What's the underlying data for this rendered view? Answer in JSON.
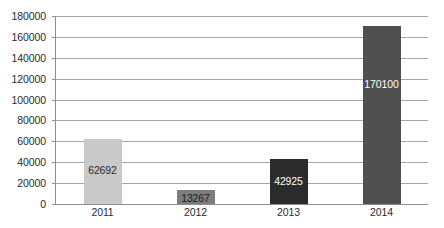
{
  "chart_data": {
    "type": "bar",
    "title": "",
    "subtitle": "",
    "xlabel": "",
    "ylabel": "",
    "categories": [
      "2011",
      "2012",
      "2013",
      "2014"
    ],
    "values": [
      62692,
      13267,
      42925,
      170100
    ],
    "data_labels": [
      "62692",
      "13267",
      "42925",
      "170100"
    ],
    "ylim": [
      0,
      180000
    ],
    "ytick_step": 20000,
    "ytick_labels": [
      "180000",
      "160000",
      "140000",
      "120000",
      "100000",
      "80000",
      "60000",
      "40000",
      "20000",
      "0"
    ],
    "ytick_values": [
      180000,
      160000,
      140000,
      120000,
      100000,
      80000,
      60000,
      40000,
      20000,
      0
    ],
    "grid": "horizontal",
    "legend": "none",
    "bar_colors": [
      "#c9c9c9",
      "#7d7d7d",
      "#2b2b2b",
      "#4f4f4f"
    ],
    "data_label_colors": [
      "#2a2a2a",
      "#1f1f1f",
      "#ffffff",
      "#ffffff"
    ],
    "gridline_color": "#a6a6a6",
    "axis_color": "#8c8c8c",
    "background_color": "#ffffff"
  }
}
